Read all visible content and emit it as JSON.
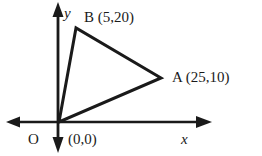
{
  "figure": {
    "background_color": "#ffffff",
    "stroke_color": "#1a1a1a"
  },
  "axes": {
    "x_label": "x",
    "y_label": "y",
    "origin_label": "O",
    "origin_coords": "(0,0)"
  },
  "points": {
    "a": {
      "name": "A",
      "label": "A (25,10)",
      "coords": "(25,10)",
      "x": 25,
      "y": 10
    },
    "b": {
      "name": "B",
      "label": "B (5,20)",
      "coords": "(5,20)",
      "x": 5,
      "y": 20
    },
    "o": {
      "name": "O",
      "label": "O",
      "coords": "(0,0)",
      "x": 0,
      "y": 0
    }
  },
  "shape": {
    "type": "triangle",
    "vertices": [
      "O",
      "A",
      "B"
    ]
  }
}
